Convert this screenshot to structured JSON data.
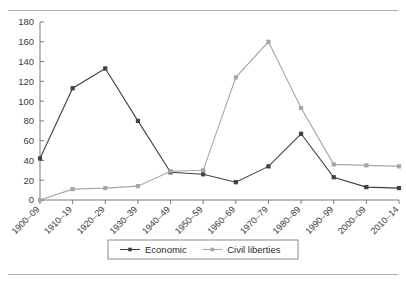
{
  "figure": {
    "has_top_rule": true,
    "has_bottom_rule": true,
    "background": "#ffffff"
  },
  "chart_data": {
    "type": "line",
    "title": "",
    "subtitle": "",
    "xlabel": "",
    "ylabel": "",
    "categories": [
      "1900–09",
      "1910–19",
      "1920–29",
      "1930–39",
      "1940–49",
      "1950–59",
      "1960–69",
      "1970–79",
      "1980–89",
      "1990–99",
      "2000–09",
      "2010–14"
    ],
    "series": [
      {
        "name": "Economic",
        "color": "#404040",
        "marker": "square",
        "values": [
          42,
          113,
          133,
          80,
          28,
          26,
          18,
          34,
          67,
          23,
          13,
          12
        ]
      },
      {
        "name": "Civil liberties",
        "color": "#a6a6a6",
        "marker": "square",
        "values": [
          0,
          11,
          12,
          14,
          29,
          30,
          124,
          160,
          93,
          36,
          35,
          34
        ]
      }
    ],
    "ylim": [
      0,
      180
    ],
    "yticks": [
      0,
      20,
      40,
      60,
      80,
      100,
      120,
      140,
      160,
      180
    ],
    "ytick_labels": [
      "0",
      "20",
      "40",
      "60",
      "80",
      "100",
      "120",
      "140",
      "160",
      "180"
    ],
    "grid": false,
    "legend_position": "bottom",
    "axis_color": "#7a7a7a",
    "xlabel_rotation": -45
  },
  "legend": {
    "items": [
      {
        "label": "Economic",
        "color": "#404040"
      },
      {
        "label": "Civil liberties",
        "color": "#a6a6a6"
      }
    ]
  }
}
